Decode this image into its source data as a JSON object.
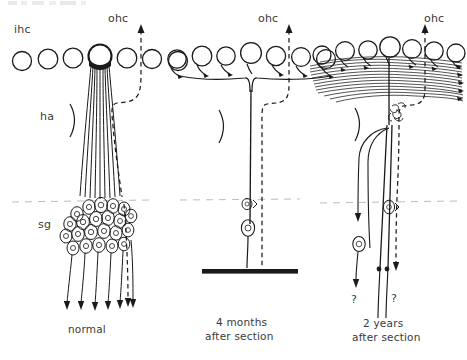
{
  "figure": {
    "title_fragment_cropped": "",
    "background_color": "#ffffff",
    "ink_color": "#1a1a1a",
    "label_color": "#3a3a3a",
    "guide_color": "#b0b0b0",
    "panel_count": 3
  },
  "panels": [
    {
      "id": "normal",
      "caption": "normal",
      "labels": {
        "inner_hair_cell": "ihc",
        "outer_hair_cell": "ohc",
        "habenula": "ha",
        "spiral_ganglion": "sg"
      },
      "hair_cell_count": 7,
      "innervated_cell_index": 4,
      "radial_fiber_count": 9,
      "ganglion_cell_count": 22,
      "descending_axon_count": 7,
      "efferent_path_style": "dashed",
      "has_habenula_bracket": true
    },
    {
      "id": "four-months",
      "caption_line1": "4 months",
      "caption_line2": "after section",
      "labels": {
        "outer_hair_cell": "ohc"
      },
      "hair_cell_count": 7,
      "radial_fiber_count": 1,
      "ganglion_cell_count": 1,
      "shrunken_cell_count": 1,
      "descending_axon_count": 0,
      "efferent_path_style": "dashed",
      "has_habenula_bracket": true,
      "has_terminal_bar": true
    },
    {
      "id": "two-years",
      "caption_line1": "2 years",
      "caption_line2": "after section",
      "labels": {
        "outer_hair_cell": "ohc",
        "query_left": "?",
        "query_right": "?"
      },
      "hair_cell_count": 7,
      "sprouting_fiber_count": 14,
      "ganglion_cell_count": 2,
      "looping_fiber_count": 1,
      "descending_axon_count": 2,
      "efferent_path_style": "dashed",
      "has_habenula_bracket": true,
      "has_sprout_tangle": true
    }
  ],
  "guides": {
    "horizontal_dashed_line_label": "osseous-spiral-lamina-level"
  }
}
